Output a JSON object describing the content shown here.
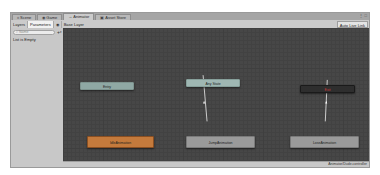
{
  "window": {
    "tabs": [
      {
        "label": "Scene",
        "icon": "scene-icon",
        "glyph": "⌗",
        "active": false
      },
      {
        "label": "Game",
        "icon": "game-icon",
        "glyph": "◉",
        "active": false
      },
      {
        "label": "Animator",
        "icon": "animator-icon",
        "glyph": "→",
        "active": true
      },
      {
        "label": "Asset Store",
        "icon": "asset-store-icon",
        "glyph": "▣",
        "active": false
      }
    ],
    "controls": "⋮ □"
  },
  "toolbar": {
    "layers_tab": "Layers",
    "parameters_tab": "Parameters",
    "eye_glyph": "◉",
    "breadcrumb": "Base Layer",
    "auto_live_link": "Auto Live Link"
  },
  "left_panel": {
    "search_placeholder": "Name",
    "search_glyph": "⌕",
    "add_glyph": "+",
    "caret_glyph": "▾",
    "empty_text": "List is Empty"
  },
  "graph": {
    "nodes": {
      "entry": {
        "label": "Entry"
      },
      "any_state": {
        "label": "Any State"
      },
      "exit": {
        "label": "Exit"
      },
      "idle": {
        "label": "IdleAnimation"
      },
      "jump": {
        "label": "JumpAnimation"
      },
      "lose": {
        "label": "LoseAnimation"
      }
    },
    "transitions": [
      {
        "from": "JumpAnimation",
        "to": "Any State"
      },
      {
        "from": "LoseAnimation",
        "to": "Exit"
      }
    ]
  },
  "footer": {
    "controller_path": "Animator/Dude.controller"
  },
  "colors": {
    "graph_bg": "#474747",
    "default_state": "#c47a3c",
    "normal_state": "#9a9a9a",
    "entry": "#8fa8a4",
    "exit": "#2e2e2e",
    "exit_text": "#cc3b3b"
  }
}
